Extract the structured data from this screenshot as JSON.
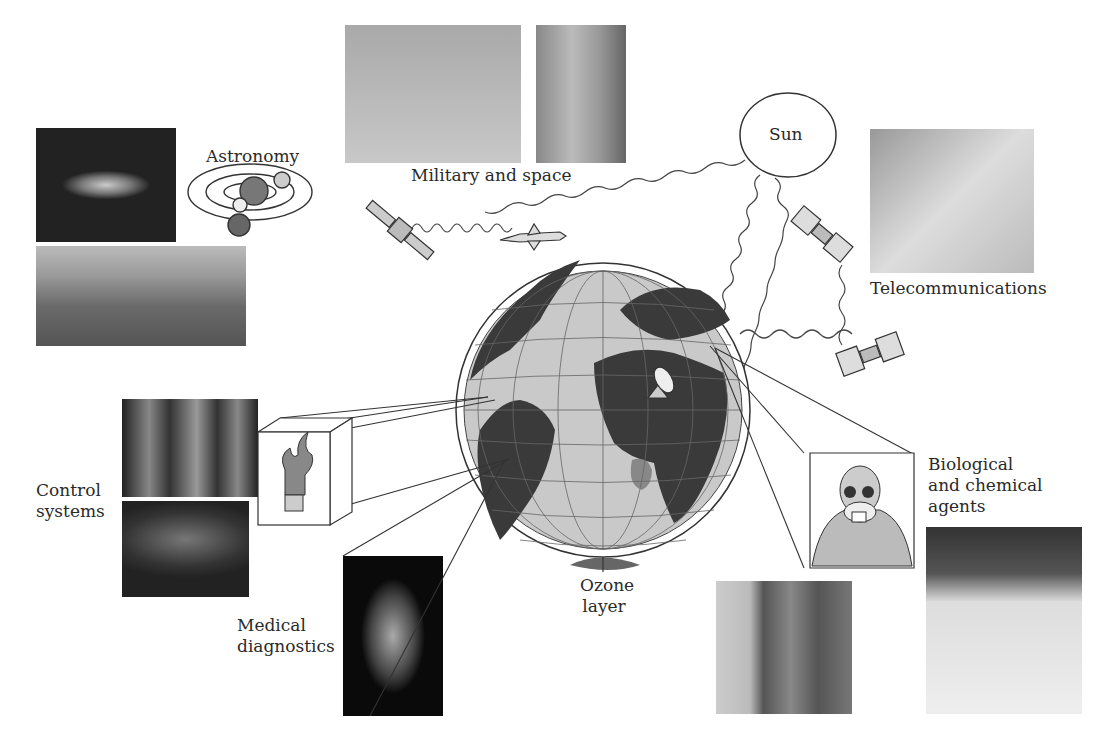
{
  "labels": {
    "astronomy": "Astronomy",
    "military": "Military and space",
    "sun": "Sun",
    "telecom": "Telecommunications",
    "control_l1": "Control",
    "control_l2": "systems",
    "medical_l1": "Medical",
    "medical_l2": "diagnostics",
    "ozone_l1": "Ozone",
    "ozone_l2": "layer",
    "bio_l1": "Biological",
    "bio_l2": "and chemical",
    "bio_l3": "agents"
  },
  "icons": [
    "sun-icon",
    "satellite-icon",
    "missile-icon",
    "solar-system-icon",
    "globe-icon",
    "radar-dish-icon",
    "flame-icon",
    "gas-mask-icon"
  ],
  "photos": [
    "galaxy-photo",
    "observatory-photo",
    "helicopter-photo",
    "rocket-launch-photo",
    "telecom-equipment-photo",
    "robot-arms-photo",
    "night-field-photo",
    "hand-xray-photo",
    "hazmat-worker-photo",
    "tower-smoke-photo"
  ]
}
